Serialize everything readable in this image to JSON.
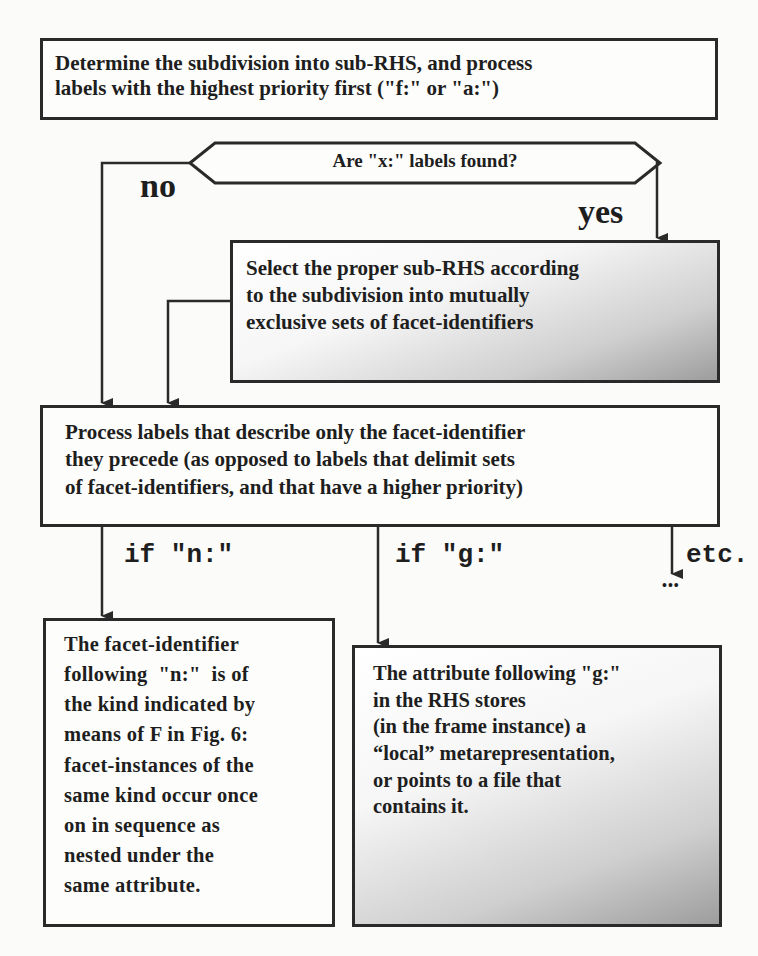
{
  "diagram": {
    "type": "flowchart",
    "nodes": {
      "start": {
        "line1": "Determine the subdivision into sub-RHS, and process",
        "line2": "labels with the highest priority first (\"f:\" or \"a:\")"
      },
      "decision": {
        "text": "Are \"x:\" labels found?"
      },
      "select": {
        "line1": "Select the proper sub-RHS according",
        "line2": "to the subdivision into mutually",
        "line3": "exclusive sets of facet-identifiers"
      },
      "process": {
        "line1": "Process labels that describe only the facet-identifier",
        "line2": "they precede (as opposed to labels that delimit sets",
        "line3": "of facet-identifiers, and that have a higher priority)"
      },
      "n_case": {
        "lines": [
          "The facet-identifier",
          "following  \"n:\"  is of",
          "the kind indicated by",
          "means of F in Fig. 6:",
          "facet-instances of the",
          "same kind occur once",
          "on in sequence as",
          "nested under the",
          "same attribute."
        ]
      },
      "g_case": {
        "lines": [
          "The attribute following \"g:\"",
          "in the RHS stores",
          "(in the frame instance) a",
          "“local” metarepresentation,",
          "or points to a file that",
          "contains it."
        ]
      }
    },
    "edge_labels": {
      "no": "no",
      "yes": "yes",
      "if_n": "if \"n:\"",
      "if_g": "if \"g:\"",
      "etc": "etc.",
      "ellipsis": "•••"
    },
    "colors": {
      "stroke": "#2a2a2a",
      "text": "#1e1e1e",
      "background": "#fbfbf9"
    }
  }
}
